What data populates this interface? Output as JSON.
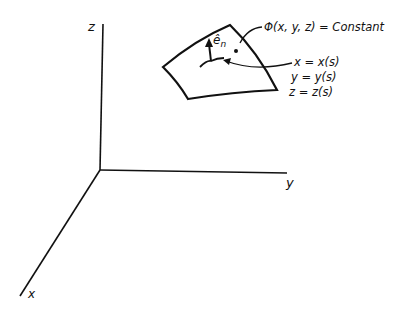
{
  "axes": {
    "x_label": "x",
    "y_label": "y",
    "z_label": "z"
  },
  "surface": {
    "normal_label": "ê",
    "normal_subscript": "n",
    "equation": "Φ(x, y, z) = Constant"
  },
  "curve": {
    "equations": [
      "x = x(s)",
      "y = y(s)",
      "z = z(s)"
    ]
  },
  "colors": {
    "stroke": "#111111",
    "background": "#ffffff"
  }
}
